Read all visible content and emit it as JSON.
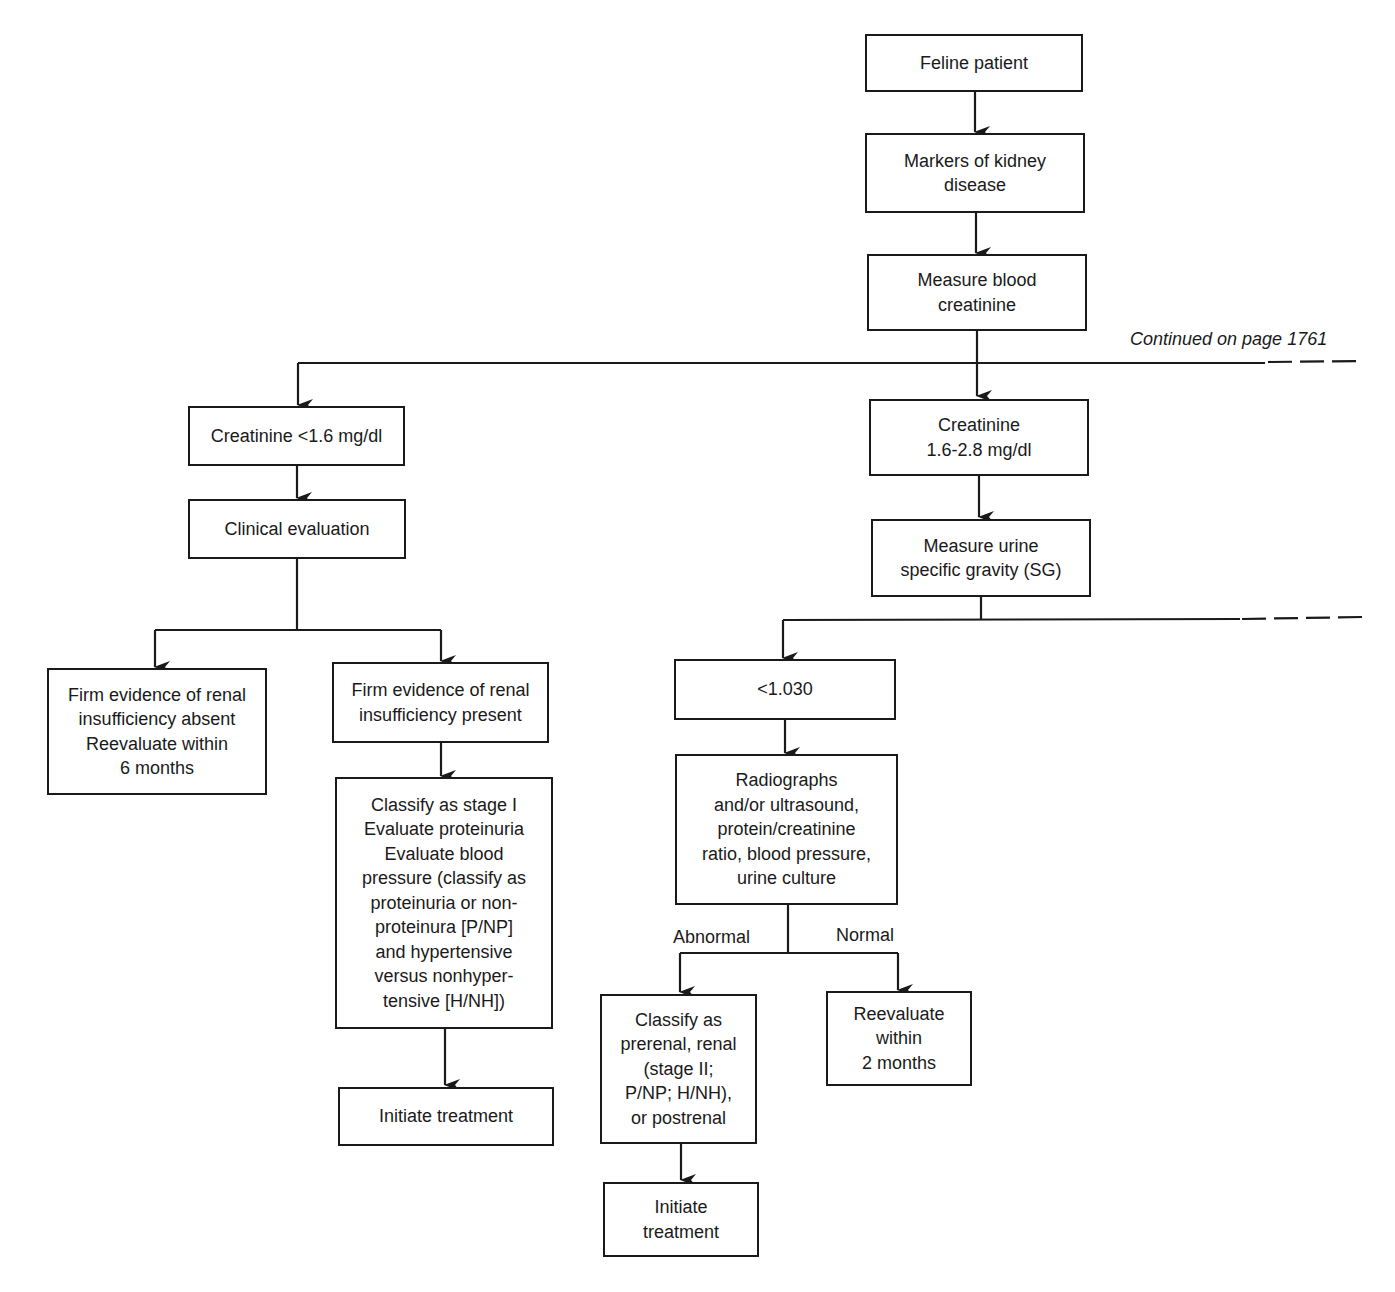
{
  "diagram": {
    "type": "flowchart",
    "continuation_note": "Continued on page 1761",
    "nodes": {
      "feline_patient": "Feline patient",
      "markers": "Markers of kidney\ndisease",
      "measure_creatinine": "Measure blood\ncreatinine",
      "creat_low": "Creatinine <1.6 mg/dl",
      "clinical_eval": "Clinical evaluation",
      "absent": "Firm evidence of renal\ninsufficiency absent\nReevaluate within\n6 months",
      "present": "Firm evidence of renal\ninsufficiency present",
      "stage1": "Classify as stage I\nEvaluate proteinuria\nEvaluate blood\npressure (classify as\nproteinuria or non-\nproteinura [P/NP]\nand hypertensive\nversus nonhyper-\ntensive [H/NH])",
      "initiate_left": "Initiate treatment",
      "creat_mid": "Creatinine\n1.6-2.8 mg/dl",
      "measure_sg": "Measure urine\nspecific gravity (SG)",
      "sg_low": "<1.030",
      "radiographs": "Radiographs\nand/or ultrasound,\nprotein/creatinine\nratio, blood pressure,\nurine culture",
      "classify_stage2": "Classify as\nprerenal, renal\n(stage II;\nP/NP; H/NH),\nor postrenal",
      "reevaluate_2mo": "Reevaluate\nwithin\n2 months",
      "initiate_right": "Initiate\ntreatment"
    },
    "edge_labels": {
      "abnormal": "Abnormal",
      "normal": "Normal"
    },
    "colors": {
      "stroke": "#1a1a1a",
      "background": "#ffffff"
    }
  }
}
